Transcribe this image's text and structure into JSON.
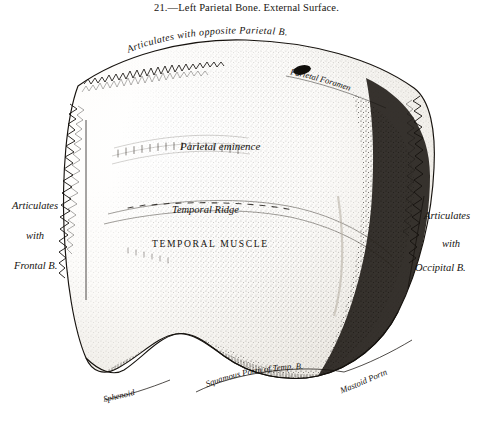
{
  "figure": {
    "caption": "21.—Left Parietal Bone.   External Surface.",
    "number": "21.",
    "title": "Left Parietal Bone.",
    "subtitle": "External Surface.",
    "kind": "anatomical-engraving"
  },
  "labels": {
    "top_arc": "Articulates   with   opposite   Parietal B.",
    "parietal_foramen": "Parietal Foramen",
    "parietal_eminence": "Parietal eminence",
    "temporal_ridge": "Temporal Ridge",
    "temporal_muscle": "TEMPORAL MUSCLE",
    "left_line1": "Articulates",
    "left_line2": "with",
    "left_line3": "Frontal B.",
    "right_line1": "Articulates",
    "right_line2": "with",
    "right_line3": "Occipital B.",
    "bottom_sphenoid": "Sphenoid",
    "bottom_squamous": "Squamous Portn of Temp. B.",
    "bottom_mastoid": "Mastoid Portn"
  },
  "style": {
    "ink": "#15120e",
    "paper": "#ffffff",
    "shade_dark": "#2b2722",
    "shade_mid": "#6d675e",
    "shade_light": "#b9b3a8"
  }
}
